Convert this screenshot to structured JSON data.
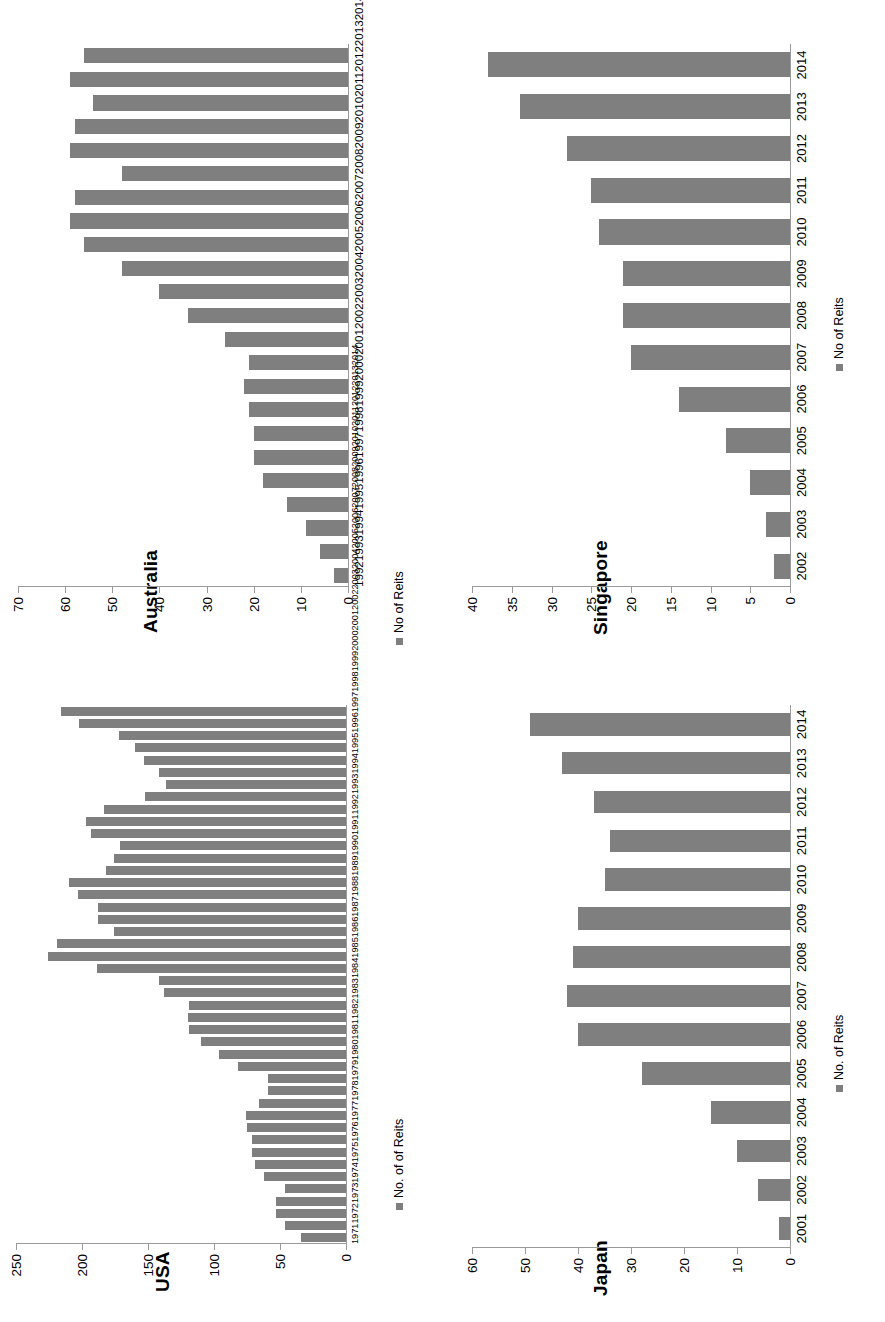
{
  "figure": {
    "bar_color": "#7f7f7f",
    "axis_color": "#9a9a9a",
    "background": "#ffffff",
    "panels": [
      "Australia",
      "Singapore",
      "USA",
      "Japan"
    ]
  },
  "chart_data": [
    {
      "id": "australia",
      "type": "bar",
      "title": "Australia",
      "legend": [
        "No of Reits"
      ],
      "legend_position": "bottom-left",
      "xlabel": "",
      "ylabel": "",
      "ylim": [
        0,
        70
      ],
      "yticks": [
        0,
        10,
        20,
        30,
        40,
        50,
        60,
        70
      ],
      "grid": false,
      "orientation": "vertical-rotated-90ccw",
      "categories": [
        "1992",
        "1993",
        "1994",
        "1995",
        "1996",
        "1997",
        "1998",
        "1999",
        "2000",
        "2001",
        "2002",
        "2003",
        "2004",
        "2005",
        "2006",
        "2007",
        "2008",
        "2009",
        "2010",
        "2011",
        "2012",
        "2013",
        "2014"
      ],
      "values": [
        3,
        6,
        9,
        13,
        18,
        20,
        20,
        21,
        22,
        21,
        26,
        34,
        40,
        48,
        56,
        59,
        58,
        48,
        59,
        58,
        54,
        59,
        56
      ]
    },
    {
      "id": "singapore",
      "type": "bar",
      "title": "Singapore",
      "legend": [
        "No of Reits"
      ],
      "legend_position": "bottom-left",
      "xlabel": "",
      "ylabel": "",
      "ylim": [
        0,
        40
      ],
      "yticks": [
        0,
        5,
        10,
        15,
        20,
        25,
        30,
        35,
        40
      ],
      "grid": false,
      "orientation": "vertical-rotated-90ccw",
      "categories": [
        "2002",
        "2003",
        "2004",
        "2005",
        "2006",
        "2007",
        "2008",
        "2009",
        "2010",
        "2011",
        "2012",
        "2013",
        "2014"
      ],
      "values": [
        2,
        3,
        5,
        8,
        14,
        20,
        21,
        21,
        24,
        25,
        28,
        34,
        38
      ]
    },
    {
      "id": "usa",
      "type": "bar",
      "title": "USA",
      "legend": [
        "No. of of Reits"
      ],
      "legend_position": "bottom-left",
      "xlabel": "",
      "ylabel": "",
      "ylim": [
        0,
        250
      ],
      "yticks": [
        0,
        50,
        100,
        150,
        200,
        250
      ],
      "grid": false,
      "orientation": "vertical-rotated-90ccw",
      "categories": [
        "1971",
        "1972",
        "1973",
        "1974",
        "1975",
        "1976",
        "1977",
        "1978",
        "1979",
        "1980",
        "1981",
        "1982",
        "1983",
        "1984",
        "1985",
        "1986",
        "1987",
        "1988",
        "1989",
        "1990",
        "1991",
        "1992",
        "1993",
        "1994",
        "1995",
        "1996",
        "1997",
        "1998",
        "1999",
        "2000",
        "2001",
        "2002",
        "2003",
        "2004",
        "2005",
        "2006",
        "2007",
        "2008",
        "2009",
        "2010",
        "2011",
        "2012",
        "2013",
        "2014"
      ],
      "values": [
        34,
        46,
        53,
        53,
        46,
        62,
        69,
        71,
        71,
        75,
        76,
        66,
        59,
        59,
        82,
        96,
        110,
        119,
        120,
        119,
        138,
        142,
        189,
        226,
        219,
        176,
        188,
        188,
        203,
        210,
        182,
        176,
        171,
        193,
        197,
        183,
        152,
        136,
        142,
        153,
        160,
        172,
        202,
        216
      ]
    },
    {
      "id": "japan",
      "type": "bar",
      "title": "Japan",
      "legend": [
        "No. of Reits"
      ],
      "legend_position": "bottom-left",
      "xlabel": "",
      "ylabel": "",
      "ylim": [
        0,
        60
      ],
      "yticks": [
        0,
        10,
        20,
        30,
        40,
        50,
        60
      ],
      "grid": false,
      "orientation": "vertical-rotated-90ccw",
      "categories": [
        "2001",
        "2002",
        "2003",
        "2004",
        "2005",
        "2006",
        "2007",
        "2008",
        "2009",
        "2010",
        "2011",
        "2012",
        "2013",
        "2014"
      ],
      "values": [
        2,
        6,
        10,
        15,
        28,
        40,
        42,
        41,
        40,
        35,
        34,
        37,
        43,
        49
      ]
    }
  ]
}
